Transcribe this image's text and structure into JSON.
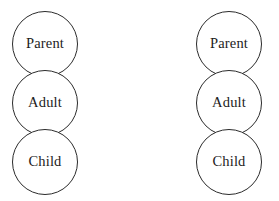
{
  "figure": {
    "type": "diagram",
    "background_color": "#ffffff",
    "stroke_color": "#2b2b2b",
    "text_color": "#1c1c1c"
  },
  "columns": [
    {
      "name": "left-ego-state-stack",
      "nodes": [
        {
          "label": "Parent"
        },
        {
          "label": "Adult"
        },
        {
          "label": "Child"
        }
      ]
    },
    {
      "name": "right-ego-state-stack",
      "nodes": [
        {
          "label": "Parent"
        },
        {
          "label": "Adult"
        },
        {
          "label": "Child"
        }
      ]
    }
  ]
}
